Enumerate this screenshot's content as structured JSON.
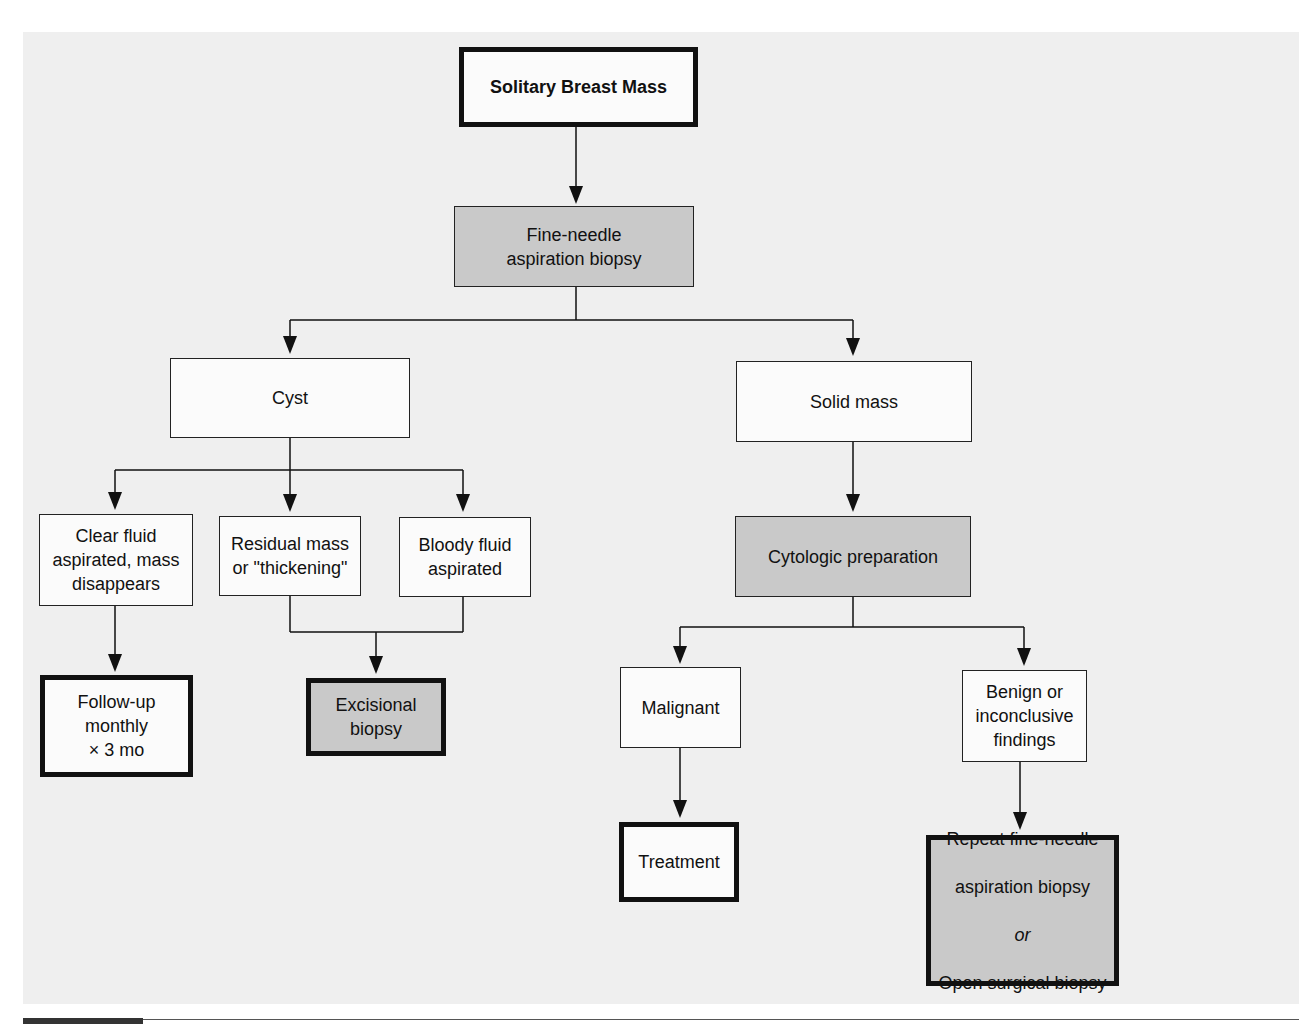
{
  "diagram": {
    "type": "flowchart",
    "nodes": {
      "root": {
        "label": "Solitary Breast Mass",
        "style": "bold-thick"
      },
      "fna": {
        "label": "Fine-needle\naspiration biopsy",
        "style": "shaded"
      },
      "cyst": {
        "label": "Cyst",
        "style": "plain"
      },
      "solid": {
        "label": "Solid mass",
        "style": "plain"
      },
      "clear_fluid": {
        "label": "Clear fluid\naspirated, mass\ndisappears",
        "style": "plain"
      },
      "residual": {
        "label": "Residual mass\nor \"thickening\"",
        "style": "plain"
      },
      "bloody": {
        "label": "Bloody fluid\naspirated",
        "style": "plain"
      },
      "followup": {
        "label": "Follow-up\nmonthly\n× 3 mo",
        "style": "thick"
      },
      "excisional": {
        "label": "Excisional\nbiopsy",
        "style": "thick-shaded"
      },
      "cytologic": {
        "label": "Cytologic preparation",
        "style": "shaded"
      },
      "malignant": {
        "label": "Malignant",
        "style": "plain"
      },
      "benign": {
        "label": "Benign or\ninconclusive\nfindings",
        "style": "plain"
      },
      "treatment": {
        "label": "Treatment",
        "style": "thick"
      },
      "repeat": {
        "line1": "Repeat fine-needle",
        "line2": "aspiration biopsy",
        "connector": "or",
        "line3": "Open surgical biopsy",
        "style": "thick-shaded"
      }
    },
    "edges": [
      [
        "root",
        "fna"
      ],
      [
        "fna",
        "cyst"
      ],
      [
        "fna",
        "solid"
      ],
      [
        "cyst",
        "clear_fluid"
      ],
      [
        "cyst",
        "residual"
      ],
      [
        "cyst",
        "bloody"
      ],
      [
        "clear_fluid",
        "followup"
      ],
      [
        "residual",
        "excisional"
      ],
      [
        "bloody",
        "excisional"
      ],
      [
        "solid",
        "cytologic"
      ],
      [
        "cytologic",
        "malignant"
      ],
      [
        "cytologic",
        "benign"
      ],
      [
        "malignant",
        "treatment"
      ],
      [
        "benign",
        "repeat"
      ]
    ],
    "colors": {
      "background": "#efefef",
      "shaded_box": "#c9c9c9",
      "box": "#fbfbfb",
      "line": "#111111"
    }
  }
}
